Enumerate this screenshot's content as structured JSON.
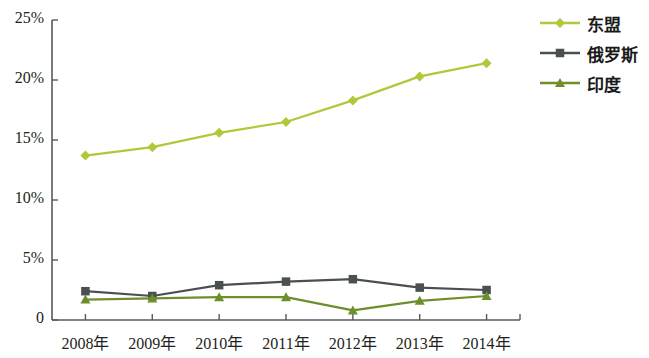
{
  "chart_data": {
    "type": "line",
    "title": "",
    "xlabel": "",
    "ylabel": "",
    "categories": [
      "2008年",
      "2009年",
      "2010年",
      "2011年",
      "2012年",
      "2013年",
      "2014年"
    ],
    "ylim": [
      0,
      25
    ],
    "yticks": [
      0,
      5,
      10,
      15,
      20,
      25
    ],
    "ytick_labels": [
      "0",
      "5%",
      "10%",
      "15%",
      "20%",
      "25%"
    ],
    "grid": false,
    "legend_position": "right-top",
    "series": [
      {
        "name": "东盟",
        "color": "#b4c63a",
        "marker": "diamond",
        "values": [
          13.7,
          14.4,
          15.6,
          16.5,
          18.3,
          20.3,
          21.4
        ]
      },
      {
        "name": "俄罗斯",
        "color": "#4a5052",
        "marker": "square",
        "values": [
          2.4,
          2.0,
          2.9,
          3.2,
          3.4,
          2.7,
          2.5
        ]
      },
      {
        "name": "印度",
        "color": "#6c8f2b",
        "marker": "triangle",
        "values": [
          1.7,
          1.8,
          1.9,
          1.9,
          0.8,
          1.6,
          2.0
        ]
      }
    ]
  },
  "axis": {
    "axis_color": "#555a5c"
  }
}
